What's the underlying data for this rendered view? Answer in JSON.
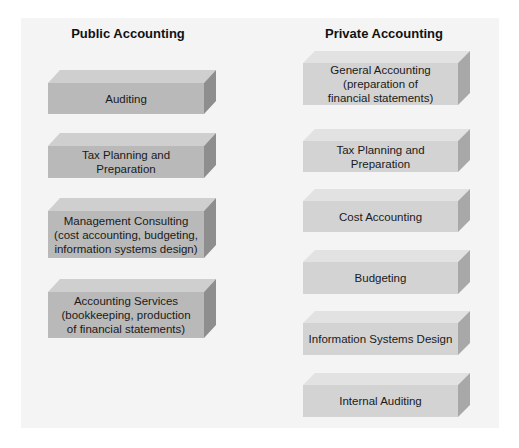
{
  "diagram": {
    "colors": {
      "background": "#ffffff",
      "panel": "#f4f4f4",
      "public_front": "#b9b9b9",
      "public_top": "#cfcfcf",
      "public_side": "#8e8e8e",
      "private_front": "#d3d3d3",
      "private_top": "#e2e2e2",
      "private_side": "#a8a8a8"
    },
    "public": {
      "title": "Public Accounting",
      "items": [
        {
          "label": "Auditing"
        },
        {
          "label": "Tax Planning and Preparation"
        },
        {
          "label": "Management Consulting (cost accounting, budgeting, information systems design)"
        },
        {
          "label": "Accounting Services (bookkeeping, production of financial statements)"
        }
      ]
    },
    "private": {
      "title": "Private Accounting",
      "items": [
        {
          "label": "General Accounting (preparation of financial statements)"
        },
        {
          "label": "Tax Planning and Preparation"
        },
        {
          "label": "Cost Accounting"
        },
        {
          "label": "Budgeting"
        },
        {
          "label": "Information Systems Design"
        },
        {
          "label": "Internal Auditing"
        }
      ]
    }
  }
}
